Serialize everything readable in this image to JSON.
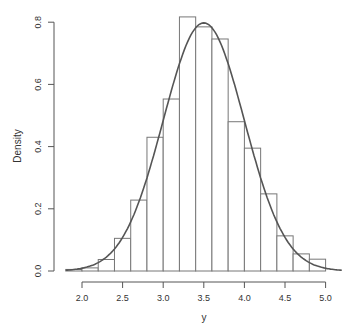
{
  "chart_data": {
    "type": "bar",
    "subtype": "histogram_with_density_curve",
    "title": "",
    "xlabel": "y",
    "ylabel": "Density",
    "xlim": [
      1.8,
      5.2
    ],
    "ylim": [
      0,
      0.8
    ],
    "x_ticks": [
      "2.0",
      "2.5",
      "3.0",
      "3.5",
      "4.0",
      "4.5",
      "5.0"
    ],
    "y_ticks": [
      "0.0",
      "0.2",
      "0.4",
      "0.6",
      "0.8"
    ],
    "grid": false,
    "legend": null,
    "bins": [
      {
        "from": 1.8,
        "to": 2.0,
        "density": 0.005
      },
      {
        "from": 2.0,
        "to": 2.2,
        "density": 0.01
      },
      {
        "from": 2.2,
        "to": 2.4,
        "density": 0.037
      },
      {
        "from": 2.4,
        "to": 2.6,
        "density": 0.105
      },
      {
        "from": 2.6,
        "to": 2.8,
        "density": 0.228
      },
      {
        "from": 2.8,
        "to": 3.0,
        "density": 0.43
      },
      {
        "from": 3.0,
        "to": 3.2,
        "density": 0.553
      },
      {
        "from": 3.2,
        "to": 3.4,
        "density": 0.817
      },
      {
        "from": 3.4,
        "to": 3.6,
        "density": 0.785
      },
      {
        "from": 3.6,
        "to": 3.8,
        "density": 0.746
      },
      {
        "from": 3.8,
        "to": 4.0,
        "density": 0.48
      },
      {
        "from": 4.0,
        "to": 4.2,
        "density": 0.395
      },
      {
        "from": 4.2,
        "to": 4.4,
        "density": 0.248
      },
      {
        "from": 4.4,
        "to": 4.6,
        "density": 0.113
      },
      {
        "from": 4.6,
        "to": 4.8,
        "density": 0.055
      },
      {
        "from": 4.8,
        "to": 5.0,
        "density": 0.038
      }
    ],
    "curve": {
      "type": "normal_density",
      "mean": 3.5,
      "sd": 0.5
    }
  }
}
